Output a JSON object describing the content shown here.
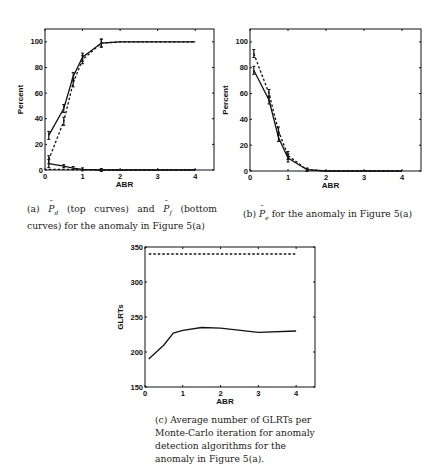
{
  "chart_data": [
    {
      "id": "a",
      "type": "line",
      "title": "",
      "xlabel": "ABR",
      "ylabel": "Percent",
      "xlim": [
        0,
        4.5
      ],
      "ylim": [
        0,
        110
      ],
      "xticks": [
        0,
        1,
        2,
        3,
        4
      ],
      "yticks": [
        0,
        20,
        40,
        60,
        80,
        100
      ],
      "grid": false,
      "legend": null,
      "series": [
        {
          "name": "Pd (solid)",
          "style": "solid",
          "error_bars": true,
          "x": [
            0.1,
            0.5,
            0.75,
            1.0,
            1.5,
            2.0,
            4.0
          ],
          "y": [
            27,
            48,
            73,
            88,
            99,
            100,
            100
          ]
        },
        {
          "name": "Pd (dashed)",
          "style": "dashed",
          "error_bars": true,
          "x": [
            0.1,
            0.5,
            0.75,
            1.0,
            1.5,
            2.0,
            4.0
          ],
          "y": [
            8,
            38,
            68,
            86,
            99,
            100,
            100
          ]
        },
        {
          "name": "Pf (solid)",
          "style": "solid",
          "error_bars": true,
          "x": [
            0.1,
            0.5,
            0.75,
            1.0,
            1.5,
            2.0,
            4.0
          ],
          "y": [
            5,
            3,
            1.5,
            0.5,
            0,
            0,
            0
          ]
        },
        {
          "name": "Pf (dashed)",
          "style": "dashed",
          "error_bars": false,
          "x": [
            0.1,
            0.5,
            0.75,
            1.0,
            1.5,
            2.0,
            4.0
          ],
          "y": [
            0.5,
            0.5,
            0.3,
            0.2,
            0,
            0,
            0
          ]
        }
      ]
    },
    {
      "id": "b",
      "type": "line",
      "title": "",
      "xlabel": "ABR",
      "ylabel": "Percent",
      "xlim": [
        0,
        4.5
      ],
      "ylim": [
        0,
        110
      ],
      "xticks": [
        0,
        1,
        2,
        3,
        4
      ],
      "yticks": [
        0,
        20,
        40,
        60,
        80,
        100
      ],
      "grid": false,
      "legend": null,
      "series": [
        {
          "name": "Pe (solid)",
          "style": "solid",
          "error_bars": true,
          "x": [
            0.1,
            0.5,
            0.75,
            1.0,
            1.5,
            2.0,
            4.0
          ],
          "y": [
            78,
            55,
            26,
            10,
            1,
            0,
            0
          ]
        },
        {
          "name": "Pe (dashed)",
          "style": "dashed",
          "error_bars": true,
          "x": [
            0.1,
            0.5,
            0.75,
            1.0,
            1.5,
            2.0,
            4.0
          ],
          "y": [
            91,
            60,
            31,
            12,
            1,
            0,
            0
          ]
        }
      ]
    },
    {
      "id": "c",
      "type": "line",
      "title": "",
      "xlabel": "ABR",
      "ylabel": "GLRTs",
      "xlim": [
        0,
        4.5
      ],
      "ylim": [
        150,
        350
      ],
      "xticks": [
        0,
        1,
        2,
        3,
        4
      ],
      "yticks": [
        150,
        200,
        250,
        300,
        350
      ],
      "grid": false,
      "legend": null,
      "series": [
        {
          "name": "GLRTs (dashed)",
          "style": "dashed",
          "error_bars": false,
          "x": [
            0.1,
            4.0
          ],
          "y": [
            340,
            340
          ]
        },
        {
          "name": "GLRTs (solid)",
          "style": "solid",
          "error_bars": false,
          "x": [
            0.1,
            0.5,
            0.75,
            1.0,
            1.5,
            2.0,
            3.0,
            4.0
          ],
          "y": [
            190,
            210,
            227,
            231,
            235,
            234,
            228,
            230
          ]
        }
      ]
    }
  ],
  "captions": {
    "a": {
      "prefix": "(a) ",
      "p1": "P",
      "p1_sub": "d",
      "mid": " (top curves) and ",
      "p2": "P",
      "p2_sub": "f",
      "suffix": " (bottom curves) for the anomaly in Figure 5(a)"
    },
    "b": {
      "prefix": "(b) ",
      "p1": "P",
      "p1_sub": "e",
      "suffix": " for the anomaly in Figure 5(a)"
    },
    "c": {
      "text": "(c) Average number of GLRTs per Monte-Carlo iteration for anomaly detection algorithms for the anomaly in Figure 5(a)."
    }
  }
}
